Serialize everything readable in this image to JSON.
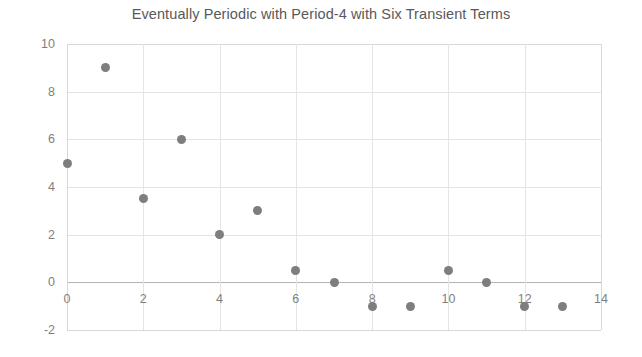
{
  "chart_data": {
    "type": "scatter",
    "title": "Eventually Periodic with Period-4 with Six Transient Terms",
    "xlabel": "",
    "ylabel": "",
    "xlim": [
      0,
      14
    ],
    "ylim": [
      -2,
      10
    ],
    "xticks": [
      0,
      2,
      4,
      6,
      8,
      10,
      12,
      14
    ],
    "yticks": [
      -2,
      0,
      2,
      4,
      6,
      8,
      10
    ],
    "xtick_labels": [
      "0",
      "2",
      "4",
      "6",
      "8",
      "10",
      "12",
      "14"
    ],
    "ytick_labels": [
      "-2",
      "0",
      "2",
      "4",
      "6",
      "8",
      "10"
    ],
    "grid": true,
    "legend": false,
    "marker_color": "#7e7e7e",
    "text_color": "#7f7f7f",
    "title_color": "#595959",
    "grid_color": "#e4e4e4",
    "axis_color": "#b4b4b4",
    "background": "#ffffff",
    "x": [
      0,
      1,
      2,
      3,
      4,
      5,
      6,
      7,
      8,
      9,
      10,
      11,
      12,
      13
    ],
    "y": [
      5,
      9,
      3.5,
      6,
      2,
      3,
      0.5,
      0,
      -1,
      -1,
      0.5,
      0,
      -1,
      -1
    ],
    "points": [
      {
        "x": 0,
        "y": 5
      },
      {
        "x": 1,
        "y": 9
      },
      {
        "x": 2,
        "y": 3.5
      },
      {
        "x": 3,
        "y": 6
      },
      {
        "x": 4,
        "y": 2
      },
      {
        "x": 5,
        "y": 3
      },
      {
        "x": 6,
        "y": 0.5
      },
      {
        "x": 7,
        "y": 0
      },
      {
        "x": 8,
        "y": -1
      },
      {
        "x": 9,
        "y": -1
      },
      {
        "x": 10,
        "y": 0.5
      },
      {
        "x": 11,
        "y": 0
      },
      {
        "x": 12,
        "y": -1
      },
      {
        "x": 13,
        "y": -1
      }
    ]
  }
}
